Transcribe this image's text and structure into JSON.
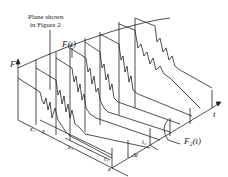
{
  "figure": {
    "annotation": {
      "line1": "Plane shown",
      "line2": "in Figure 2"
    },
    "labels": {
      "F_axis": "F",
      "t_axis": "t",
      "Ft": "F(t)",
      "Fz": "F₂(t)",
      "z1": "z₁",
      "z": "z",
      "z2": "z₂",
      "t1": "t₁",
      "t2": "t₂",
      "z_bottom": "z",
      "delta_t": "Δt"
    },
    "colors": {
      "line": "#222222",
      "background": "#ffffff"
    }
  }
}
